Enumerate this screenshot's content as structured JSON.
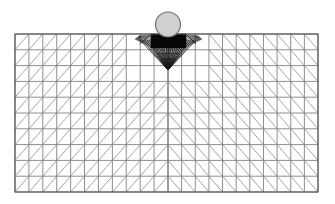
{
  "figure": {
    "type": "fem-mesh-diagram",
    "background_color": "#ffffff",
    "width": 335,
    "height": 204
  },
  "indenter": {
    "name": "circular-rigid-indenter",
    "shape": "circle",
    "center_x": 168,
    "center_y": 24.5,
    "radius": 12.5,
    "fill_color": "#d0d0d0",
    "stroke_color": "#707070",
    "stroke_width": 1.2
  },
  "domain_block": {
    "name": "meshed-half-space",
    "left": 15,
    "top": 34,
    "right": 318,
    "bottom": 192,
    "width": 303,
    "height": 158,
    "outline_color": "#555555",
    "outline_width": 1.1,
    "fill_color": "#ffffff"
  },
  "mesh": {
    "element_type": "triangle",
    "columns_per_half": 11,
    "rows": 10,
    "center_x": 168,
    "grid_line_color": "#7a7a7a",
    "grid_line_width": 0.85,
    "diagonal_line_color": "#8f8f8f",
    "diagonal_line_width": 0.8,
    "diagonal_orientation_left": "bottom-left-to-top-right",
    "diagonal_orientation_right": "top-left-to-bottom-right",
    "symmetry": "mirrored-about-vertical-centerline"
  },
  "refinement_zone": {
    "name": "contact-refinement-patch",
    "description": "dense black refined elements directly beneath the indenter contact",
    "left": 151,
    "right": 186,
    "top": 34,
    "bottom": 48,
    "fill_color": "#111111",
    "line_color": "#000000"
  },
  "fan": {
    "name": "transition-fan",
    "description": "radial fan of element edges converging from the refined patch to a single node below",
    "apex_x": 168,
    "apex_y": 70,
    "top_y": 40,
    "spread_left": 140,
    "spread_right": 196,
    "ray_count": 24,
    "line_color": "#1a1a1a",
    "line_width": 0.75
  },
  "centerline": {
    "name": "symmetry-axis",
    "x": 168,
    "top": 34,
    "bottom": 192,
    "color": "#6a6a6a",
    "width": 0.9
  }
}
